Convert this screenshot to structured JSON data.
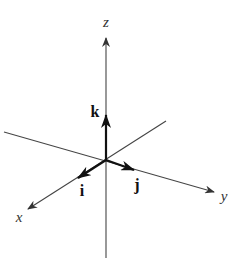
{
  "diagram": {
    "origin": [
      105,
      160
    ],
    "axes": [
      {
        "name": "z",
        "label": "z",
        "from": [
          106,
          258
        ],
        "to": [
          106,
          38
        ],
        "label_pos": [
          106,
          27
        ]
      },
      {
        "name": "y",
        "label": "y",
        "from": [
          4,
          132
        ],
        "to": [
          214,
          192
        ],
        "label_pos": [
          224,
          201
        ]
      },
      {
        "name": "x",
        "label": "x",
        "from": [
          166,
          121
        ],
        "to": [
          28,
          209
        ],
        "label_pos": [
          19,
          222
        ]
      }
    ],
    "vectors": [
      {
        "name": "k",
        "label": "k",
        "from": [
          106,
          160
        ],
        "to": [
          106,
          115
        ],
        "label_pos": [
          95,
          117
        ]
      },
      {
        "name": "j",
        "label": "j",
        "from": [
          106,
          160
        ],
        "to": [
          134,
          170
        ],
        "label_pos": [
          137,
          190
        ]
      },
      {
        "name": "i",
        "label": "i",
        "from": [
          106,
          160
        ],
        "to": [
          78,
          178
        ],
        "label_pos": [
          82,
          196
        ]
      }
    ],
    "colors": {
      "axis": "#444444",
      "vector": "#111111",
      "background": "#ffffff"
    }
  }
}
